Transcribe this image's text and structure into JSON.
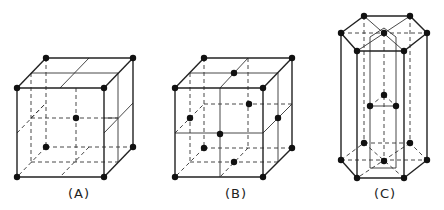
{
  "figure": {
    "panels": [
      {
        "id": "A",
        "label": "(A)",
        "structure": "body-centered cubic",
        "label_x": 79,
        "label_y": 188
      },
      {
        "id": "B",
        "label": "(B)",
        "structure": "face-centered cubic",
        "label_x": 236,
        "label_y": 188
      },
      {
        "id": "C",
        "label": "(C)",
        "structure": "hexagonal close-packed",
        "label_x": 385,
        "label_y": 188
      }
    ],
    "colors": {
      "line": "#222222",
      "atom": "#111111",
      "background": "#ffffff"
    }
  }
}
